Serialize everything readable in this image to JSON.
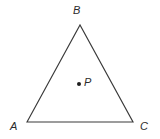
{
  "figure": {
    "kind": "geometry-diagram",
    "canvas": {
      "width": 160,
      "height": 139,
      "background": "#ffffff"
    },
    "stroke": {
      "color": "#3a3a3a",
      "width": 1.15
    },
    "text_color": "#2b2b2b",
    "triangle": {
      "name": "triangle-ABC",
      "vertices": [
        {
          "id": "A",
          "label": "A",
          "x": 27,
          "y": 122,
          "label_x": 10,
          "label_y": 121
        },
        {
          "id": "B",
          "label": "B",
          "x": 80,
          "y": 25,
          "label_x": 73,
          "label_y": 5
        },
        {
          "id": "C",
          "label": "C",
          "x": 133,
          "y": 122,
          "label_x": 140,
          "label_y": 121
        }
      ],
      "edges": [
        {
          "id": "AB",
          "from": "A",
          "to": "B"
        },
        {
          "id": "BC",
          "from": "B",
          "to": "C"
        },
        {
          "id": "CA",
          "from": "C",
          "to": "A"
        }
      ]
    },
    "interior_points": [
      {
        "id": "P",
        "label": "P",
        "x": 79,
        "y": 84,
        "marker_radius": 2,
        "label_x": 84,
        "label_y": 77
      }
    ]
  }
}
